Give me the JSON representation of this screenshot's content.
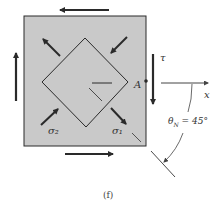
{
  "figure": {
    "caption": "(f)",
    "colors": {
      "element_fill": "#c9c9c9",
      "stroke": "#2a2a2a",
      "background": "#ffffff"
    },
    "labels": {
      "shear": "τ",
      "point": "A",
      "x_axis": "x",
      "sigma2": "σ₂",
      "sigma1": "σ₁",
      "angle": "θN = 45°"
    }
  }
}
